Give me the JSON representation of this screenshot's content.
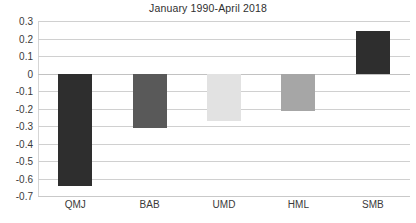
{
  "chart_data": {
    "type": "bar",
    "title": "January 1990-April 2018",
    "xlabel": "",
    "ylabel": "",
    "categories": [
      "QMJ",
      "BAB",
      "UMD",
      "HML",
      "SMB"
    ],
    "values": [
      -0.645,
      -0.31,
      -0.27,
      -0.215,
      0.245
    ],
    "series": [
      {
        "name": "Factor value",
        "values": [
          -0.645,
          -0.31,
          -0.27,
          -0.215,
          0.245
        ]
      }
    ],
    "bar_colors": [
      "#2e2e2e",
      "#595959",
      "#e2e2e2",
      "#a6a6a6",
      "#2e2e2e"
    ],
    "ylim": [
      -0.7,
      0.3
    ],
    "ytick_values": [
      0.3,
      0.2,
      0.1,
      0,
      -0.1,
      -0.2,
      -0.3,
      -0.4,
      -0.5,
      -0.6,
      -0.7
    ],
    "ytick_labels": [
      "0.3",
      "0.2",
      "0.1",
      "0",
      "-0.1",
      "-0.2",
      "-0.3",
      "-0.4",
      "-0.5",
      "-0.6",
      "-0.7"
    ],
    "grid": true,
    "grid_color": "#d0d0d0",
    "zero_line_value": 0,
    "legend": null,
    "legend_position": "none",
    "background_color": "#ffffff",
    "text_color": "#3a3a3a"
  }
}
